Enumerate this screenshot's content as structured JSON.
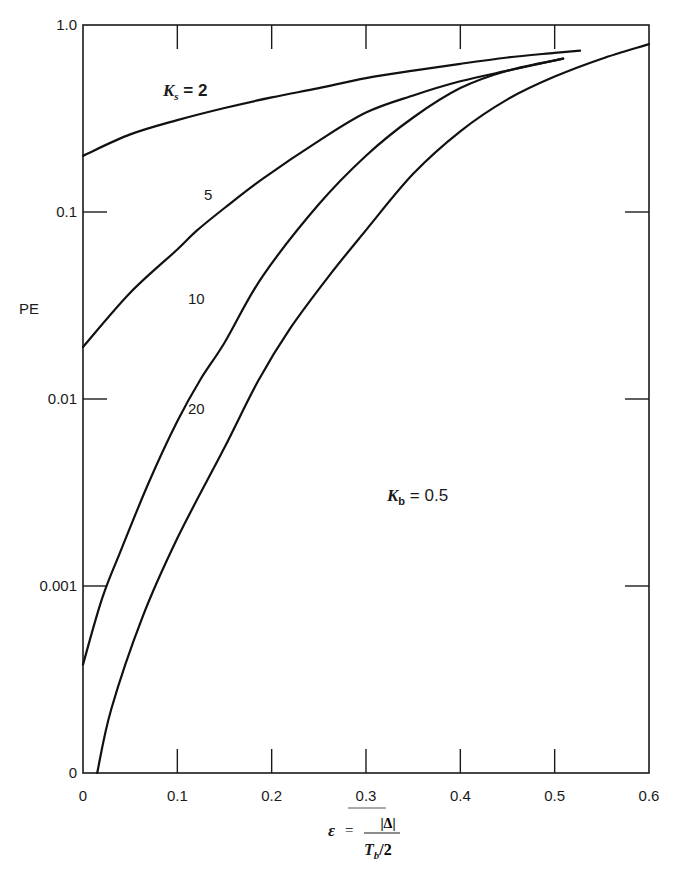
{
  "chart_data": {
    "type": "line",
    "title": "",
    "xlabel": "ε = |Δ| / (T_b/2)",
    "ylabel": "PE",
    "xlim": [
      0,
      0.6
    ],
    "ylim": [
      0.0001,
      1.0
    ],
    "yscale": "log",
    "grid": false,
    "x_ticks": [
      "0",
      "0.1",
      "0.2",
      "0.3",
      "0.4",
      "0.5",
      "0.6"
    ],
    "y_ticks": [
      "1.0",
      "0.1",
      "0.01",
      "0.001",
      "0"
    ],
    "y_tick_values": [
      1.0,
      0.1,
      0.01,
      0.001,
      0.0001
    ],
    "annotations": [
      {
        "text": "K_b = 0.5",
        "x": 0.32,
        "y": 0.0017
      },
      {
        "text": "K_s = 2",
        "x": 0.1,
        "y": 0.48
      }
    ],
    "series": [
      {
        "name": "K_s = 2",
        "label": "K_s = 2",
        "points": [
          [
            0.0,
            0.2
          ],
          [
            0.05,
            0.26
          ],
          [
            0.1,
            0.31
          ],
          [
            0.15,
            0.36
          ],
          [
            0.2,
            0.41
          ],
          [
            0.25,
            0.46
          ],
          [
            0.3,
            0.52
          ],
          [
            0.35,
            0.57
          ],
          [
            0.4,
            0.62
          ],
          [
            0.45,
            0.67
          ],
          [
            0.5,
            0.71
          ],
          [
            0.527,
            0.73
          ]
        ]
      },
      {
        "name": "K_s = 5",
        "label": "5",
        "points": [
          [
            0.0,
            0.019
          ],
          [
            0.05,
            0.037
          ],
          [
            0.1,
            0.063
          ],
          [
            0.12,
            0.079
          ],
          [
            0.15,
            0.105
          ],
          [
            0.19,
            0.15
          ],
          [
            0.25,
            0.24
          ],
          [
            0.3,
            0.34
          ],
          [
            0.35,
            0.42
          ],
          [
            0.4,
            0.5
          ],
          [
            0.45,
            0.57
          ],
          [
            0.509,
            0.66
          ]
        ]
      },
      {
        "name": "K_s = 10",
        "label": "10",
        "points": [
          [
            0.0,
            0.00038
          ],
          [
            0.02,
            0.00085
          ],
          [
            0.039,
            0.0015
          ],
          [
            0.07,
            0.0036
          ],
          [
            0.1,
            0.0076
          ],
          [
            0.124,
            0.0126
          ],
          [
            0.15,
            0.02
          ],
          [
            0.19,
            0.045
          ],
          [
            0.25,
            0.11
          ],
          [
            0.3,
            0.2
          ],
          [
            0.35,
            0.32
          ],
          [
            0.4,
            0.46
          ],
          [
            0.45,
            0.57
          ],
          [
            0.509,
            0.66
          ]
        ]
      },
      {
        "name": "K_s = 20",
        "label": "20",
        "points": [
          [
            0.015,
            0.0001
          ],
          [
            0.03,
            0.00022
          ],
          [
            0.063,
            0.00068
          ],
          [
            0.1,
            0.0018
          ],
          [
            0.15,
            0.0055
          ],
          [
            0.186,
            0.0126
          ],
          [
            0.22,
            0.024
          ],
          [
            0.26,
            0.045
          ],
          [
            0.3,
            0.08
          ],
          [
            0.35,
            0.16
          ],
          [
            0.4,
            0.27
          ],
          [
            0.45,
            0.4
          ],
          [
            0.5,
            0.53
          ],
          [
            0.55,
            0.66
          ],
          [
            0.6,
            0.79
          ]
        ]
      }
    ]
  },
  "labels": {
    "y_axis_title": "PE",
    "x_axis_eps": "ε",
    "x_axis_equals": "=",
    "x_axis_numerator": "|Δ|",
    "x_axis_denominator_T": "T",
    "x_axis_denominator_sub": "b",
    "x_axis_denominator_rest": "/2",
    "ks_K": "K",
    "ks_sub": "s",
    "ks_rest": " = 2",
    "kb_K": "K",
    "kb_sub": "b",
    "kb_rest": " = 0.5",
    "curve_5": "5",
    "curve_10": "10",
    "curve_20": "20"
  }
}
